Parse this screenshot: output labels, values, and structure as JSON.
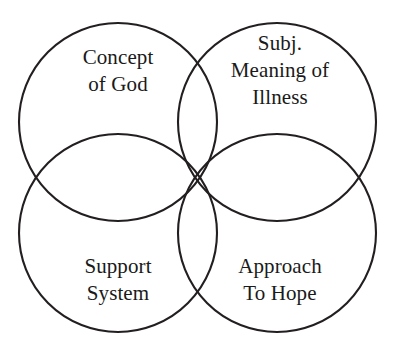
{
  "diagram": {
    "type": "venn",
    "title": "",
    "background_color": "#ffffff",
    "stroke_color": "#231f20",
    "stroke_width": 2,
    "circles": [
      {
        "id": "concept-of-god",
        "position": "top-left",
        "label_lines": [
          "Concept",
          "of God"
        ],
        "cx": 118,
        "cy": 122,
        "r": 99
      },
      {
        "id": "subj-meaning-of-illness",
        "position": "top-right",
        "label_lines": [
          "Subj.",
          "Meaning of",
          "Illness"
        ],
        "cx": 277,
        "cy": 122,
        "r": 99
      },
      {
        "id": "support-system",
        "position": "bottom-left",
        "label_lines": [
          "Support",
          "System"
        ],
        "cx": 118,
        "cy": 233,
        "r": 99
      },
      {
        "id": "approach-to-hope",
        "position": "bottom-right",
        "label_lines": [
          "Approach",
          "To Hope"
        ],
        "cx": 277,
        "cy": 233,
        "r": 99
      }
    ],
    "labels": {
      "concept_of_god": {
        "line1": "Concept",
        "line2": "of God"
      },
      "subj_meaning_of_illness": {
        "line1": "Subj.",
        "line2": "Meaning of",
        "line3": "Illness"
      },
      "support_system": {
        "line1": "Support",
        "line2": "System"
      },
      "approach_to_hope": {
        "line1": "Approach",
        "line2": "To Hope"
      }
    }
  }
}
